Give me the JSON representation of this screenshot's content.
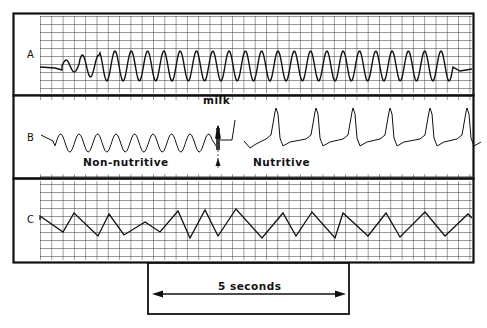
{
  "figure": {
    "panels": [
      {
        "label": "A",
        "description": "regular sucking waveform on grid"
      },
      {
        "label": "B",
        "left_caption": "Non-nutritive",
        "right_caption": "Nutritive",
        "marker_label": "milk"
      },
      {
        "label": "C",
        "description": "irregular waveform on grid"
      }
    ],
    "scale_bar": {
      "label": "5 seconds"
    }
  },
  "colors": {
    "ink": "#111111",
    "grid": "#222222",
    "paper": "#ffffff"
  }
}
